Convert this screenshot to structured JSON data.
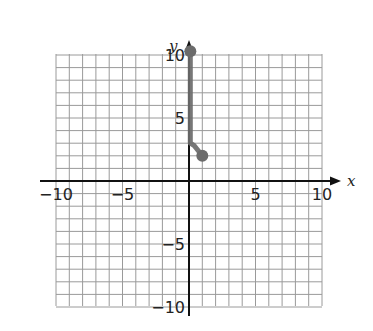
{
  "chart_data": {
    "type": "line",
    "title": "",
    "xlabel": "x",
    "ylabel": "y",
    "xlim": [
      -10,
      10
    ],
    "ylim": [
      -10,
      10
    ],
    "grid": true,
    "grid_step": 1,
    "x_ticks": [
      -10,
      -5,
      5,
      10
    ],
    "y_ticks": [
      10,
      5,
      -5,
      -10
    ],
    "x_tick_labels": [
      "−10",
      "−5",
      "5",
      "10"
    ],
    "y_tick_labels": [
      "10",
      "5",
      "−5",
      "−10"
    ],
    "series": [
      {
        "name": "curve",
        "points": [
          [
            0.1,
            10.3
          ],
          [
            0.1,
            3.0
          ],
          [
            0.4,
            2.8
          ],
          [
            1.0,
            2.0
          ]
        ],
        "endpoints": [
          [
            0.1,
            10.3
          ],
          [
            1.0,
            2.0
          ]
        ],
        "color": "#6b6b6b"
      }
    ],
    "legend": null
  },
  "axes": {
    "x_label": "x",
    "y_label": "y"
  }
}
